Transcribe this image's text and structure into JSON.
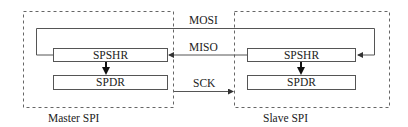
{
  "diagram": {
    "type": "SPI master-slave connection",
    "colors": {
      "line": "#555555",
      "text": "#222222",
      "background": "#ffffff"
    },
    "modules": [
      {
        "id": "master",
        "label": "Master SPI",
        "registers": {
          "shift": "SPSHR",
          "data": "SPDR"
        }
      },
      {
        "id": "slave",
        "label": "Slave SPI",
        "registers": {
          "shift": "SPSHR",
          "data": "SPDR"
        }
      }
    ],
    "signals": [
      {
        "name": "MOSI",
        "from": "master.SPSHR",
        "to": "slave.SPSHR"
      },
      {
        "name": "MISO",
        "from": "slave.SPSHR",
        "to": "master.SPSHR"
      },
      {
        "name": "SCK",
        "from": "master",
        "to": "slave"
      }
    ]
  }
}
